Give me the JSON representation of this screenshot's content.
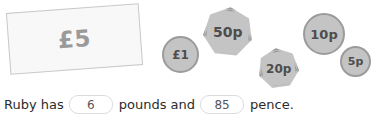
{
  "money": {
    "note": {
      "label": "£5",
      "type": "banknote",
      "value_pounds": 5
    },
    "coins": [
      {
        "id": "1pound",
        "label": "£1",
        "shape": "circle",
        "value_pence": 100
      },
      {
        "id": "50p",
        "label": "50p",
        "shape": "heptagon",
        "value_pence": 50
      },
      {
        "id": "20p",
        "label": "20p",
        "shape": "heptagon",
        "value_pence": 20
      },
      {
        "id": "10p",
        "label": "10p",
        "shape": "circle",
        "value_pence": 10
      },
      {
        "id": "5p",
        "label": "5p",
        "shape": "circle",
        "value_pence": 5
      }
    ]
  },
  "question": {
    "lead_text": "Ruby has",
    "middle_text": "pounds and",
    "trailing_text": "pence.",
    "pounds_answer": "6",
    "pence_answer": "85"
  },
  "colors": {
    "page_background": "#ffffff",
    "note_fill": "#f8f8f8",
    "note_border": "#c8c8c8",
    "note_text": "#9a9a9a",
    "coin_fill": "#c4c4c4",
    "coin_border": "#9b9b9b",
    "coin_text": "#4d4d4d",
    "sentence_text": "#2b2b2b",
    "input_border": "#dcdcdc",
    "input_text": "#555555"
  }
}
